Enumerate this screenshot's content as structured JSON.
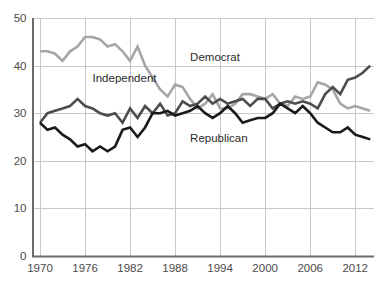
{
  "chart_data": {
    "type": "line",
    "title": "",
    "subtitle": "",
    "xlabel": "",
    "ylabel": "",
    "xlim": [
      1969,
      2014.5
    ],
    "ylim": [
      0,
      50
    ],
    "grid": true,
    "legend_position": "inline-annotations",
    "xticks": [
      1970,
      1976,
      1982,
      1988,
      1994,
      2000,
      2006,
      2012
    ],
    "xtick_labels": [
      "1970",
      "1976",
      "1982",
      "1988",
      "1994",
      "2000",
      "2006",
      "2012"
    ],
    "yticks": [
      0,
      10,
      20,
      30,
      40,
      50
    ],
    "ytick_labels": [
      "0",
      "10",
      "20",
      "30",
      "40",
      "50"
    ],
    "x": [
      1970,
      1971,
      1972,
      1973,
      1974,
      1975,
      1976,
      1977,
      1978,
      1979,
      1980,
      1981,
      1982,
      1983,
      1984,
      1985,
      1986,
      1987,
      1988,
      1989,
      1990,
      1991,
      1992,
      1993,
      1994,
      1995,
      1996,
      1997,
      1998,
      1999,
      2000,
      2001,
      2002,
      2003,
      2004,
      2005,
      2006,
      2007,
      2008,
      2009,
      2010,
      2011,
      2012,
      2013,
      2014
    ],
    "series": [
      {
        "name": "Democrat",
        "color": "#a6a6a6",
        "annotation": "Democrat",
        "values": [
          43,
          43,
          42.5,
          41,
          43,
          44,
          46,
          46,
          45.5,
          44,
          44.5,
          43,
          41,
          44,
          40,
          37.5,
          35,
          33.5,
          36,
          35.5,
          33,
          31,
          32,
          34,
          31,
          31,
          32,
          34,
          34,
          33.5,
          33,
          34,
          32,
          31.5,
          33.5,
          33,
          33.5,
          36.5,
          36,
          35,
          32,
          31,
          31.5,
          31,
          30.5
        ]
      },
      {
        "name": "Independent",
        "color": "#4d4d4d",
        "annotation": "Independent",
        "values": [
          28,
          30,
          30.5,
          31,
          31.5,
          33,
          31.5,
          31,
          30,
          29.5,
          30,
          28,
          31,
          29,
          31.5,
          30,
          32,
          29.5,
          30,
          32.5,
          31.5,
          32,
          33.5,
          32,
          33,
          32,
          32.5,
          33,
          31.5,
          33,
          33,
          31,
          32,
          32.5,
          32,
          32.5,
          32,
          31,
          34,
          35.5,
          34,
          37,
          37.5,
          38.5,
          40
        ]
      },
      {
        "name": "Republican",
        "color": "#1a1a1a",
        "annotation": "Republican",
        "values": [
          28,
          26.5,
          27,
          25.5,
          24.5,
          23,
          23.5,
          22,
          23,
          22,
          23,
          26.5,
          27,
          25,
          27,
          30,
          30,
          30.5,
          29.5,
          30,
          30.5,
          31.5,
          30,
          29,
          30,
          31.5,
          30,
          28,
          28.5,
          29,
          29,
          30,
          32,
          31,
          30,
          31.5,
          30,
          28,
          27,
          26,
          26,
          27,
          25.5,
          25,
          24.5
        ]
      }
    ],
    "annotations": [
      {
        "label": "Democrat",
        "x": 1990,
        "y": 41
      },
      {
        "label": "Independent",
        "x": 1977,
        "y": 36.5
      },
      {
        "label": "Republican",
        "x": 1990,
        "y": 24
      }
    ],
    "axis_color": "#6b6b6b",
    "grid_color": "#c8c8c8",
    "background": "#ffffff"
  }
}
